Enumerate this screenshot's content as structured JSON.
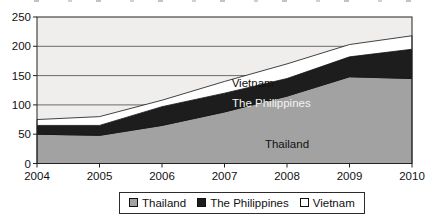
{
  "chart_data": {
    "type": "area",
    "stacked": true,
    "title": "",
    "x": [
      2004,
      2005,
      2006,
      2007,
      2008,
      2009,
      2010
    ],
    "series": [
      {
        "name": "Thailand",
        "values": [
          50,
          48,
          65,
          88,
          115,
          148,
          145
        ],
        "color": "#a2a2a2"
      },
      {
        "name": "The Philippines",
        "values": [
          15,
          17,
          32,
          32,
          30,
          34,
          50
        ],
        "color": "#1d1d1d"
      },
      {
        "name": "Vietnam",
        "values": [
          10,
          15,
          11,
          20,
          25,
          21,
          23
        ],
        "color": "#ffffff"
      }
    ],
    "ylim": [
      0,
      250
    ],
    "y_ticks": [
      0,
      50,
      100,
      150,
      200,
      250
    ],
    "grid": "horizontal",
    "plot_bg": "#efeeec",
    "legend_position": "bottom",
    "annotations": [
      {
        "text": "Vietnam",
        "x": 2007.45,
        "y": 137,
        "color": "#111111"
      },
      {
        "text": "The Philippines",
        "x": 2007.75,
        "y": 104,
        "color": "#f4f3f1"
      },
      {
        "text": "Thailand",
        "x": 2008.0,
        "y": 34,
        "color": "#111111"
      }
    ]
  },
  "legend": {
    "items": [
      {
        "label": "Thailand",
        "swatch": "#a2a2a2"
      },
      {
        "label": "The Philippines",
        "swatch": "#1d1d1d"
      },
      {
        "label": "Vietnam",
        "swatch": "#ffffff"
      }
    ]
  }
}
